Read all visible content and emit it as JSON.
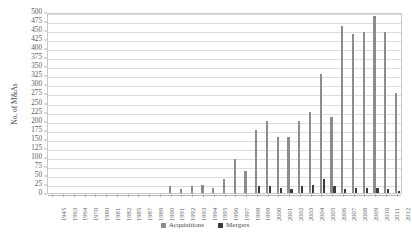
{
  "chart_data": {
    "type": "bar",
    "title": "",
    "xlabel": "",
    "ylabel": "No. of M&As",
    "ylim": [
      0,
      500
    ],
    "ytick_step": 25,
    "grid": "horizontal",
    "legend_position": "bottom-center",
    "categories": [
      "1945",
      "1963",
      "1964",
      "1970",
      "1980",
      "1981",
      "1982",
      "1985",
      "1987",
      "1989",
      "1990",
      "1991",
      "1992",
      "1993",
      "1994",
      "1995",
      "1996",
      "1997",
      "1998",
      "1999",
      "2000",
      "2001",
      "2002",
      "2003",
      "2004",
      "2005",
      "2006",
      "2007",
      "2008",
      "2009",
      "2010",
      "2011",
      "2012"
    ],
    "yticks": [
      "0",
      "25",
      "50",
      "75",
      "100",
      "125",
      "150",
      "175",
      "200",
      "225",
      "250",
      "275",
      "300",
      "325",
      "350",
      "375",
      "400",
      "425",
      "450",
      "475",
      "500"
    ],
    "series": [
      {
        "name": "Acquisitions",
        "color": "#8c8c8c",
        "values": [
          0,
          0,
          0,
          0,
          0,
          0,
          0,
          0,
          0,
          0,
          0,
          18,
          12,
          20,
          22,
          15,
          38,
          95,
          60,
          175,
          200,
          155,
          155,
          200,
          225,
          330,
          210,
          460,
          440,
          445,
          490,
          445,
          275
        ]
      },
      {
        "name": "Mergers",
        "color": "#3b3b3b",
        "values": [
          0,
          0,
          0,
          0,
          0,
          0,
          0,
          0,
          0,
          0,
          0,
          0,
          0,
          0,
          0,
          0,
          0,
          0,
          0,
          18,
          20,
          15,
          12,
          20,
          22,
          40,
          18,
          12,
          15,
          13,
          15,
          10,
          6
        ]
      }
    ]
  },
  "legend": {
    "items": [
      {
        "label": "Acquisitions",
        "color": "#8c8c8c"
      },
      {
        "label": "Mergers",
        "color": "#3b3b3b"
      }
    ]
  }
}
